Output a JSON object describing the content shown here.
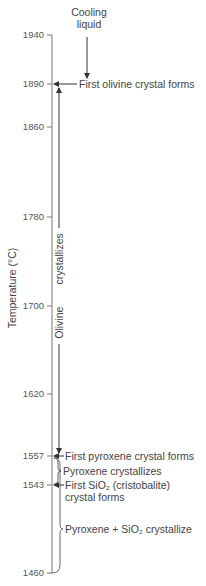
{
  "diagram": {
    "type": "cooling-crystallization-sequence",
    "axis": {
      "label": "Temperature (°C)",
      "ticks": [
        {
          "value": "1940",
          "y": 35
        },
        {
          "value": "1890",
          "y": 84
        },
        {
          "value": "1860",
          "y": 127
        },
        {
          "value": "1780",
          "y": 217
        },
        {
          "value": "1700",
          "y": 306
        },
        {
          "value": "1620",
          "y": 394
        },
        {
          "value": "1557",
          "y": 456
        },
        {
          "value": "1543",
          "y": 485
        },
        {
          "value": "1460",
          "y": 573
        }
      ]
    },
    "cooling_label_line1": "Cooling",
    "cooling_label_line2": "liquid",
    "events": {
      "first_olivine": "First olivine crystal forms",
      "olivine_crystallizes": "Olivine      crystallizes",
      "olivine_word": "Olivine",
      "crystallizes_word": "crystallizes",
      "first_pyroxene": "First pyroxene crystal forms",
      "pyroxene_crystallizes": "Pyroxene crystallizes",
      "first_sio2_line1": "First SiO₂ (cristobalite)",
      "first_sio2_line2": "crystal forms",
      "pyroxene_sio2": "Pyroxene + SiO₂ crystallize"
    },
    "colors": {
      "line": "#555555",
      "text": "#444444"
    }
  }
}
